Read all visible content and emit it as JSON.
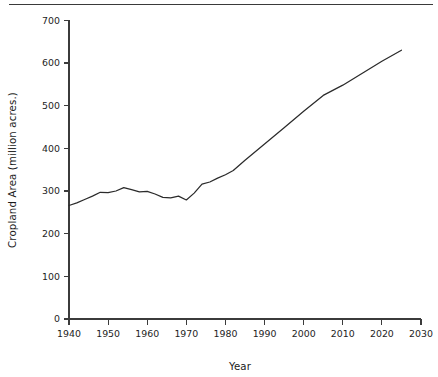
{
  "figure": {
    "has_top_rule": true,
    "background_color": "#ffffff",
    "line_color": "#2b2b2b",
    "axis_color": "#3b3b3b"
  },
  "chart_data": {
    "type": "line",
    "title": "",
    "xlabel": "Year",
    "ylabel": "Cropland Area (million acres.)",
    "xlim": [
      1940,
      2030
    ],
    "ylim": [
      0,
      700
    ],
    "xticks": [
      1940,
      1950,
      1960,
      1970,
      1980,
      1990,
      2000,
      2010,
      2020,
      2030
    ],
    "xticklabels": [
      "1940",
      "1950",
      "1960",
      "1970",
      "1980",
      "1990",
      "2000",
      "2010",
      "2020",
      "2030"
    ],
    "yticks": [
      0,
      100,
      200,
      300,
      400,
      500,
      600,
      700
    ],
    "yticklabels": [
      "0",
      "100",
      "200",
      "300",
      "400",
      "500",
      "600",
      "700"
    ],
    "grid": false,
    "legend": null,
    "series": [
      {
        "name": "Cropland Area",
        "x": [
          1940,
          1942,
          1944,
          1946,
          1948,
          1950,
          1952,
          1954,
          1956,
          1958,
          1960,
          1962,
          1964,
          1966,
          1968,
          1970,
          1972,
          1974,
          1976,
          1978,
          1980,
          1982,
          1985,
          1990,
          1995,
          2000,
          2005,
          2010,
          2015,
          2020,
          2025
        ],
        "y": [
          266,
          272,
          280,
          288,
          297,
          296,
          300,
          308,
          303,
          298,
          299,
          293,
          285,
          284,
          288,
          279,
          295,
          316,
          321,
          330,
          338,
          348,
          372,
          410,
          448,
          487,
          524,
          548,
          576,
          604,
          630
        ]
      }
    ]
  }
}
